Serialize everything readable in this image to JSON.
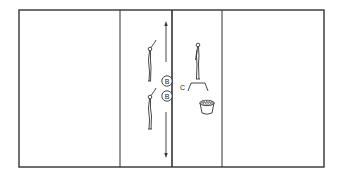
{
  "diagram": {
    "type": "volleyball-court-drill",
    "colors": {
      "line": "#333333",
      "background": "#ffffff"
    },
    "court": {
      "outer": {
        "x": 19,
        "y": 10,
        "width": 305,
        "height": 157
      },
      "attack_line_left_x": 120,
      "net_x": 172,
      "attack_line_right_x": 222
    },
    "players": [
      {
        "label": "B",
        "x": 167,
        "y": 81
      },
      {
        "label": "B",
        "x": 167,
        "y": 96
      }
    ],
    "coach": {
      "label": "C"
    },
    "movement_arrows": [
      {
        "direction": "up",
        "x": 166,
        "y1": 62,
        "y2": 22
      },
      {
        "direction": "down",
        "x": 166,
        "y1": 112,
        "y2": 158
      }
    ],
    "equipment": [
      {
        "name": "ball-basket"
      },
      {
        "name": "coach-stand"
      }
    ]
  }
}
